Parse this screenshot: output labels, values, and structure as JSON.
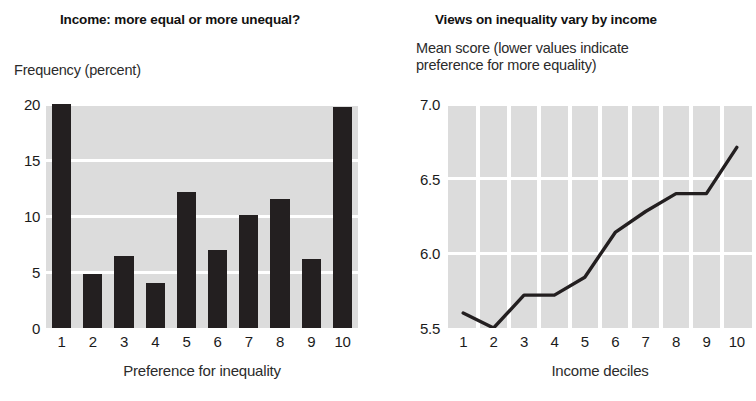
{
  "colors": {
    "bar": "#231f20",
    "plot_bg": "#dcdcdc",
    "grid": "#ffffff",
    "line": "#231f20",
    "text": "#1b1b1b"
  },
  "left_panel": {
    "title": "Income: more equal or more unequal?",
    "y_axis_note": "Frequency (percent)",
    "x_axis_caption": "Preference for inequality"
  },
  "right_panel": {
    "title": "Views on inequality vary by income",
    "y_axis_note_line1": "Mean score (lower values indicate",
    "y_axis_note_line2": "preference for more equality)",
    "x_axis_caption": "Income deciles"
  },
  "chart_data": [
    {
      "type": "bar",
      "title": "Income: more equal or more unequal?",
      "xlabel": "Preference for inequality",
      "ylabel": "Frequency (percent)",
      "categories": [
        "1",
        "2",
        "3",
        "4",
        "5",
        "6",
        "7",
        "8",
        "9",
        "10"
      ],
      "values": [
        20.0,
        4.8,
        6.4,
        4.0,
        12.1,
        7.0,
        10.1,
        11.5,
        6.2,
        19.7
      ],
      "yticks": [
        0,
        5,
        10,
        15,
        20
      ],
      "ytick_labels": [
        "0",
        "5",
        "10",
        "15",
        "20"
      ],
      "ylim": [
        0,
        20
      ],
      "grid": "horizontal",
      "legend": "none"
    },
    {
      "type": "line",
      "title": "Views on inequality vary by income",
      "xlabel": "Income deciles",
      "ylabel": "Mean score (lower values indicate preference for more equality)",
      "x": [
        "1",
        "2",
        "3",
        "4",
        "5",
        "6",
        "7",
        "8",
        "9",
        "10"
      ],
      "values": [
        5.6,
        5.5,
        5.72,
        5.72,
        5.84,
        6.14,
        6.28,
        6.4,
        6.4,
        6.71
      ],
      "yticks": [
        5.5,
        6.0,
        6.5,
        7.0
      ],
      "ytick_labels": [
        "5.5",
        "6.0",
        "6.5",
        "7.0"
      ],
      "ylim": [
        5.5,
        7.0
      ],
      "grid": "both",
      "legend": "none"
    }
  ]
}
